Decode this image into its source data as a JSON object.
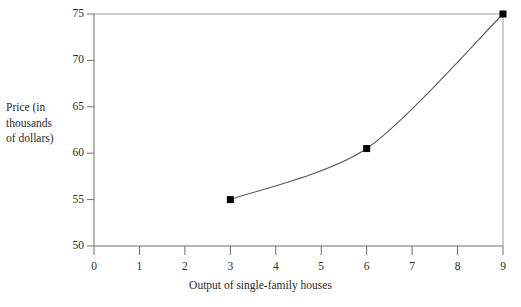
{
  "figure": {
    "clipped_header_text": "",
    "background_color": "#ffffff",
    "axis_color": "#6e6e6e",
    "curve_color": "#5a5a5a",
    "marker_color": "#000000",
    "guide_color": "#9a9a9a"
  },
  "chart_data": {
    "type": "line",
    "title": "",
    "xlabel": "Output of single-family houses",
    "ylabel": "Price (in thousands of dollars)",
    "ylabel_lines": [
      "Price (in",
      "thousands",
      "of dollars)"
    ],
    "x": [
      3,
      6,
      9
    ],
    "values": [
      55,
      60.5,
      75
    ],
    "series": [
      {
        "name": "Supply curve",
        "x": [
          3,
          6,
          9
        ],
        "values": [
          55,
          60.5,
          75
        ]
      }
    ],
    "points": [
      {
        "x": 3,
        "y": 55
      },
      {
        "x": 6,
        "y": 60.5
      },
      {
        "x": 9,
        "y": 75
      }
    ],
    "xlim": [
      0,
      9
    ],
    "ylim": [
      50,
      75
    ],
    "xticks": [
      0,
      1,
      2,
      3,
      4,
      5,
      6,
      7,
      8,
      9
    ],
    "xtick_labels": [
      "0",
      "1",
      "2",
      "3",
      "4",
      "5",
      "6",
      "7",
      "8",
      "9"
    ],
    "yticks": [
      50,
      55,
      60,
      65,
      70,
      75
    ],
    "ytick_labels": [
      "50",
      "55",
      "60",
      "65",
      "70",
      "75"
    ],
    "grid": false,
    "legend": null,
    "annotations": [
      {
        "type": "horizontal-guide",
        "y": 75,
        "from_x": 0,
        "to_x": 9
      },
      {
        "type": "vertical-guide",
        "x": 9,
        "from_y": 50,
        "to_y": 75
      }
    ],
    "marker": "square",
    "curvature": "convex-increasing"
  }
}
